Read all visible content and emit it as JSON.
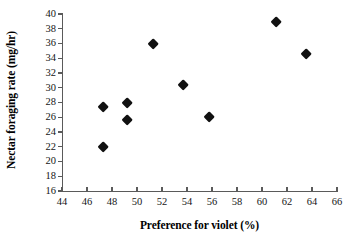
{
  "chart_data": {
    "type": "scatter",
    "title": "",
    "xlabel": "Preference for violet (%)",
    "ylabel": "Nectar foraging rate (mg/hr)",
    "xlim": [
      44,
      66
    ],
    "ylim": [
      16,
      40
    ],
    "xticks": [
      44,
      46,
      48,
      50,
      52,
      54,
      56,
      58,
      60,
      62,
      64,
      66
    ],
    "yticks": [
      16,
      18,
      20,
      22,
      24,
      26,
      28,
      30,
      32,
      34,
      36,
      38,
      40
    ],
    "grid": false,
    "legend": null,
    "marker": "filled-diamond",
    "marker_color": "#111111",
    "points": [
      {
        "x": 47.3,
        "y": 27.3
      },
      {
        "x": 47.3,
        "y": 22.0
      },
      {
        "x": 49.2,
        "y": 27.9
      },
      {
        "x": 49.2,
        "y": 25.6
      },
      {
        "x": 51.3,
        "y": 35.9
      },
      {
        "x": 53.7,
        "y": 30.3
      },
      {
        "x": 55.8,
        "y": 26.0
      },
      {
        "x": 61.1,
        "y": 38.9
      },
      {
        "x": 63.5,
        "y": 34.6
      }
    ],
    "x": [
      47.3,
      47.3,
      49.2,
      49.2,
      51.3,
      53.7,
      55.8,
      61.1,
      63.5
    ],
    "values": [
      27.3,
      22.0,
      27.9,
      25.6,
      35.9,
      30.3,
      26.0,
      38.9,
      34.6
    ]
  }
}
